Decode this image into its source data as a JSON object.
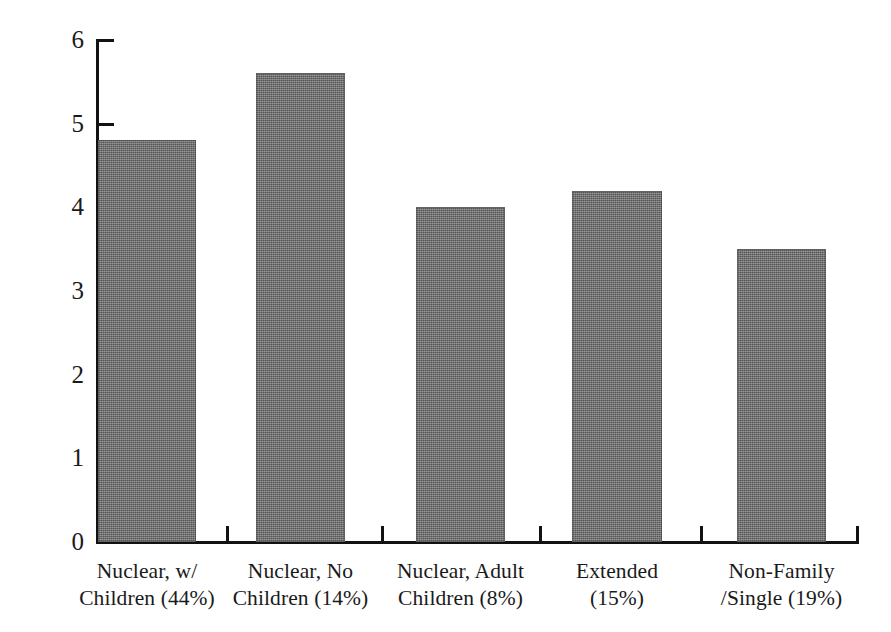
{
  "chart_data": {
    "type": "bar",
    "title": "",
    "subtitle": "",
    "xlabel": "",
    "ylabel": "",
    "categories": [
      "Nuclear, w/ Children (44%)",
      "Nuclear, No Children (14%)",
      "Nuclear, Adult Children (8%)",
      "Extended (15%)",
      "Non-Family /Single (19%)"
    ],
    "category_lines": [
      [
        "Nuclear, w/",
        "Children (44%)"
      ],
      [
        "Nuclear, No",
        "Children (14%)"
      ],
      [
        "Nuclear, Adult",
        "Children (8%)"
      ],
      [
        "Extended",
        "(15%)"
      ],
      [
        "Non-Family",
        "/Single (19%)"
      ]
    ],
    "values": [
      4.8,
      5.6,
      4.0,
      4.2,
      3.5
    ],
    "ylim": [
      0,
      6
    ],
    "yticks": [
      0,
      1,
      2,
      3,
      4,
      5,
      6
    ],
    "ytick_labels": [
      "0",
      "1",
      "2",
      "3",
      "4",
      "5",
      "6"
    ],
    "xtick_labels": [],
    "grid": false,
    "legend": false,
    "legend_position": "none",
    "bar_color": "#6e6e6e",
    "axis_color": "#121212",
    "background_color": "#ffffff"
  },
  "axis": {
    "y_labels": [
      "6",
      "5",
      "4",
      "3",
      "2",
      "1",
      "0"
    ]
  },
  "bars": [
    {
      "label": "Nuclear, w/ Children (44%)",
      "value": "4.8"
    },
    {
      "label": "Nuclear, No Children (14%)",
      "value": "5.6"
    },
    {
      "label": "Nuclear, Adult Children (8%)",
      "value": "4.0"
    },
    {
      "label": "Extended (15%)",
      "value": "4.2"
    },
    {
      "label": "Non-Family /Single (19%)",
      "value": "3.5"
    }
  ]
}
